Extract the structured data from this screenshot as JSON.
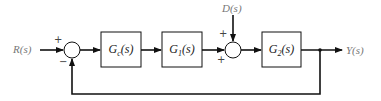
{
  "diagram": {
    "type": "block-diagram",
    "input": {
      "label": "R(s)"
    },
    "output": {
      "label": "Y(s)"
    },
    "disturbance": {
      "label": "D(s)"
    },
    "blocks": [
      {
        "id": "Gc",
        "label": "Gc(s)",
        "main": "G",
        "sub": "c",
        "tail": "(s)"
      },
      {
        "id": "G1",
        "label": "G1(s)",
        "main": "G",
        "sub": "1",
        "tail": "(s)"
      },
      {
        "id": "G2",
        "label": "G2(s)",
        "main": "G",
        "sub": "2",
        "tail": "(s)"
      }
    ],
    "summing_junctions": [
      {
        "id": "sum1",
        "signs": {
          "top_left": "+",
          "bottom_left": "−"
        }
      },
      {
        "id": "sum2",
        "signs": {
          "top_left": "+",
          "bottom_left": "+"
        }
      }
    ],
    "feedback": "unity negative feedback from Y(s) to sum1"
  }
}
